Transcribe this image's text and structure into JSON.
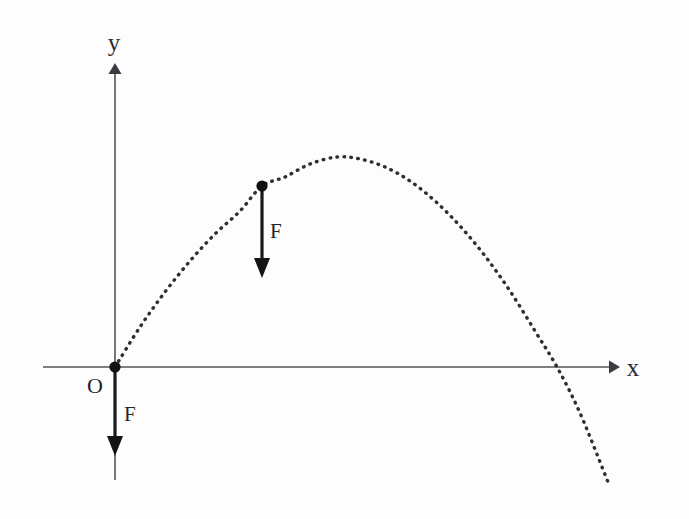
{
  "figure": {
    "background_color": "#fdfdfd",
    "ink_color": "#2e2e33",
    "axis_color": "#55555a"
  },
  "axes": {
    "x_axis": {
      "label": "x",
      "icon": "arrow-right-icon",
      "start_px": [
        43,
        367
      ],
      "end_px": [
        617,
        367
      ],
      "arrow_tip_px": [
        617,
        367
      ]
    },
    "y_axis": {
      "label": "y",
      "icon": "arrow-up-icon",
      "start_px": [
        115,
        480
      ],
      "end_px": [
        115,
        66
      ],
      "arrow_tip_px": [
        115,
        66
      ]
    },
    "origin": {
      "label": "O",
      "position_px": [
        115,
        367
      ]
    }
  },
  "markers": [
    {
      "name": "launch-point",
      "label": "O",
      "position_px": [
        115,
        367
      ],
      "radius_px": 5.5
    },
    {
      "name": "trajectory-point",
      "label": "",
      "position_px": [
        262,
        186
      ],
      "radius_px": 5.5
    }
  ],
  "force_vectors": [
    {
      "name": "force-at-trajectory-point",
      "label": "F",
      "direction": "down",
      "from_px": [
        262,
        190
      ],
      "to_px": [
        262,
        277
      ],
      "length_px": 87,
      "label_position_px": [
        278,
        230
      ]
    },
    {
      "name": "force-at-origin",
      "label": "F",
      "direction": "down",
      "from_px": [
        115,
        371
      ],
      "to_px": [
        115,
        456
      ],
      "length_px": 85,
      "label_position_px": [
        132,
        414
      ]
    }
  ],
  "chart_data": {
    "type": "line",
    "xlabel": "x",
    "ylabel": "y",
    "style": "dotted",
    "grid": false,
    "legend": false,
    "annotations": [
      "O",
      "F",
      "F",
      "x",
      "y"
    ],
    "curve_name": "parabolic-trajectory",
    "vertex_px": [
      337,
      157
    ],
    "points_px": [
      [
        115,
        367
      ],
      [
        140,
        327
      ],
      [
        165,
        292
      ],
      [
        190,
        261
      ],
      [
        215,
        234
      ],
      [
        240,
        211
      ],
      [
        262,
        186
      ],
      [
        285,
        177
      ],
      [
        310,
        164
      ],
      [
        337,
        157
      ],
      [
        360,
        159
      ],
      [
        385,
        167
      ],
      [
        410,
        181
      ],
      [
        435,
        201
      ],
      [
        460,
        226
      ],
      [
        485,
        256
      ],
      [
        510,
        291
      ],
      [
        535,
        331
      ],
      [
        557,
        367
      ],
      [
        580,
        413
      ],
      [
        608,
        482
      ]
    ],
    "x_axis_crossing_px": 557
  },
  "labels": {
    "x_axis": "x",
    "y_axis": "y",
    "origin": "O",
    "force_upper": "F",
    "force_lower": "F"
  }
}
